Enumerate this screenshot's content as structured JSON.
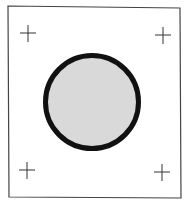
{
  "figure": {
    "frame": {
      "x1": 8,
      "y1": 7,
      "x2": 180,
      "y2": 198,
      "color": "#444444"
    },
    "circle": {
      "cx": 92,
      "cy": 102,
      "r": 46.5,
      "stroke_width": 5,
      "stroke": "#111111",
      "fill": "#d9d9d9"
    },
    "crosshairs": [
      {
        "id": "top-left",
        "x": 28,
        "y": 33
      },
      {
        "id": "top-right",
        "x": 163,
        "y": 35
      },
      {
        "id": "bottom-left",
        "x": 27,
        "y": 170
      },
      {
        "id": "bottom-right",
        "x": 162,
        "y": 172
      }
    ],
    "colors": {
      "background": "#ffffff",
      "line": "#333333"
    }
  }
}
